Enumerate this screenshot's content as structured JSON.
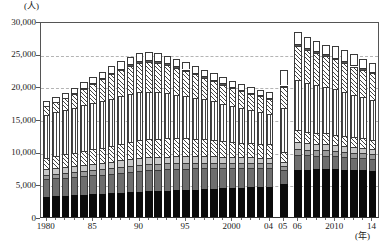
{
  "chart_data": {
    "type": "bar",
    "stacked": true,
    "title": "",
    "xlabel": "(年)",
    "ylabel": "(人)",
    "ylim": [
      0,
      30000
    ],
    "yticks": [
      0,
      5000,
      10000,
      15000,
      20000,
      25000,
      30000
    ],
    "ytick_labels": [
      "0",
      "5,000",
      "10,000",
      "15,000",
      "20,000",
      "25,000",
      "30,000"
    ],
    "grid": true,
    "grid_axis": "y",
    "legend": "none",
    "x": [
      1980,
      1981,
      1982,
      1983,
      1984,
      1985,
      1986,
      1987,
      1988,
      1989,
      1990,
      1991,
      1992,
      1993,
      1994,
      1995,
      1996,
      1997,
      1998,
      1999,
      2000,
      2001,
      2002,
      2003,
      2004,
      2005,
      2006,
      2007,
      2008,
      2009,
      2010,
      2011,
      2012,
      2013,
      2014
    ],
    "xtick_labels": [
      "1980",
      "85",
      "90",
      "95",
      "2000",
      "04",
      "05",
      "06",
      "2010",
      "14"
    ],
    "xtick_values": [
      1980,
      1985,
      1990,
      1995,
      2000,
      2004,
      2005,
      2006,
      2010,
      2014
    ],
    "group_breaks_after": [
      2004,
      2005
    ],
    "series": [
      {
        "name": "series-1",
        "pattern": "solid-black",
        "color": "#0b0b0b",
        "values": [
          3050,
          3150,
          3200,
          3300,
          3350,
          3450,
          3500,
          3600,
          3700,
          3800,
          3900,
          3950,
          4000,
          4050,
          4100,
          4150,
          4200,
          4250,
          4350,
          4400,
          4450,
          4500,
          4550,
          4600,
          4650,
          5100,
          7200,
          7250,
          7300,
          7350,
          7300,
          7250,
          7200,
          7150,
          7100
        ]
      },
      {
        "name": "series-2",
        "pattern": "solid-dark-gray",
        "color": "#6e6e6e",
        "values": [
          2700,
          2750,
          2800,
          2850,
          2900,
          2950,
          3000,
          3050,
          3100,
          3150,
          3200,
          3250,
          3250,
          3250,
          3250,
          3250,
          3250,
          3200,
          3150,
          3100,
          3050,
          3000,
          2950,
          2900,
          2850,
          2100,
          2350,
          2200,
          2100,
          2050,
          2000,
          1950,
          1900,
          1850,
          1800
        ]
      },
      {
        "name": "series-3",
        "pattern": "solid-mid-gray",
        "color": "#9a9a9a",
        "values": [
          700,
          720,
          740,
          760,
          780,
          800,
          820,
          840,
          860,
          880,
          900,
          900,
          900,
          900,
          900,
          900,
          880,
          860,
          840,
          820,
          800,
          780,
          760,
          740,
          720,
          560,
          900,
          860,
          840,
          820,
          800,
          780,
          760,
          740,
          720
        ]
      },
      {
        "name": "series-4",
        "pattern": "solid-light-gray",
        "color": "#c8c8c8",
        "values": [
          850,
          860,
          880,
          900,
          920,
          940,
          960,
          980,
          1000,
          1020,
          1040,
          1040,
          1040,
          1040,
          1030,
          1020,
          1000,
          980,
          960,
          940,
          920,
          900,
          880,
          860,
          840,
          640,
          1000,
          980,
          960,
          940,
          920,
          900,
          880,
          860,
          840
        ]
      },
      {
        "name": "series-5",
        "pattern": "diagonal-hatch",
        "color": "#ffffff",
        "values": [
          1750,
          1850,
          1950,
          2050,
          2150,
          2250,
          2350,
          2450,
          2550,
          2650,
          2750,
          2800,
          2800,
          2800,
          2750,
          2700,
          2650,
          2600,
          2500,
          2400,
          2300,
          2200,
          2150,
          2100,
          2050,
          1550,
          1800,
          1750,
          1700,
          1650,
          1600,
          1550,
          1500,
          1450,
          1400
        ]
      },
      {
        "name": "series-6",
        "pattern": "vertical-line",
        "color": "#ffffff",
        "values": [
          6600,
          6700,
          6800,
          6900,
          7000,
          7100,
          7150,
          7200,
          7250,
          7300,
          7300,
          7250,
          7100,
          6900,
          6700,
          6500,
          6300,
          6100,
          5900,
          5700,
          5500,
          5300,
          5100,
          4900,
          4700,
          6800,
          7700,
          7500,
          7300,
          7100,
          6900,
          6700,
          6500,
          6300,
          6100
        ]
      },
      {
        "name": "series-7",
        "pattern": "diagonal-hatch-2",
        "color": "#ffffff",
        "values": [
          1300,
          1500,
          1800,
          2100,
          2500,
          2900,
          3300,
          3700,
          4050,
          4350,
          4550,
          4600,
          4500,
          4300,
          4050,
          3800,
          3550,
          3300,
          3100,
          2900,
          2700,
          2550,
          2450,
          2350,
          2300,
          3200,
          5200,
          5050,
          4900,
          4700,
          4600,
          4450,
          4300,
          4150,
          4050
        ]
      },
      {
        "name": "series-8",
        "pattern": "thin-dark",
        "color": "#555555",
        "values": [
          60,
          70,
          80,
          90,
          110,
          130,
          160,
          190,
          220,
          250,
          280,
          290,
          290,
          280,
          270,
          260,
          250,
          240,
          230,
          220,
          210,
          200,
          190,
          180,
          170,
          180,
          320,
          310,
          300,
          290,
          280,
          270,
          260,
          250,
          240
        ]
      },
      {
        "name": "series-9",
        "pattern": "white-open",
        "color": "#ffffff",
        "values": [
          720,
          760,
          800,
          850,
          900,
          950,
          1000,
          1060,
          1100,
          1150,
          1180,
          1200,
          1180,
          1150,
          1120,
          1080,
          1050,
          1020,
          1000,
          980,
          950,
          930,
          900,
          880,
          860,
          2400,
          1900,
          1700,
          1550,
          1400,
          1850,
          1700,
          1600,
          1500,
          1400
        ]
      }
    ]
  },
  "axis": {
    "y_unit": "(人)",
    "x_unit": "(年)"
  }
}
